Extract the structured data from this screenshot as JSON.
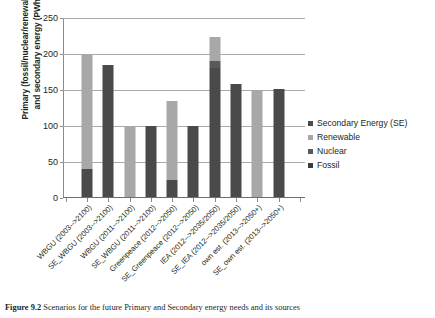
{
  "chart_data": {
    "type": "bar",
    "subtype": "stacked-bar",
    "title": "",
    "xlabel": "",
    "ylabel": "Primary (fossil/nuclear/renewable) and secondary energy (PWh)",
    "ylabel_lines": [
      "Primary (fossil/nuclear/renewable)",
      "and secondary energy (PWh)"
    ],
    "ylim": [
      0,
      250
    ],
    "yticks": [
      0,
      50,
      100,
      150,
      200,
      250
    ],
    "ytick_labels": [
      "0",
      "50",
      "100",
      "150",
      "200",
      "250"
    ],
    "grid": true,
    "grid_axis": "y",
    "legend_position": "right",
    "categories": [
      "WBGU (2003-->2100)",
      "SE_WBGU (2003-->2100)",
      "WBGU (2011-->2100)",
      "SE_WBGU (2011-->2100)",
      "Greenpeace (2012-->2050)",
      "SE_Greenpeace (2012-->2050)",
      "IEA (2012-->2035/2050)",
      "SE_IEA (2012-->2035/2050)",
      "own est. (2013-->2050+)",
      "SE_own est. (2013-->2050+)"
    ],
    "series": [
      {
        "name": "Fossil",
        "color": "#4a4a4a",
        "values": [
          40,
          0,
          0,
          0,
          25,
          0,
          180,
          0,
          0,
          0
        ]
      },
      {
        "name": "Nuclear",
        "color": "#595959",
        "values": [
          0,
          0,
          0,
          0,
          0,
          0,
          10,
          0,
          0,
          0
        ]
      },
      {
        "name": "Renewable",
        "color": "#a8a8a8",
        "values": [
          160,
          0,
          100,
          0,
          110,
          0,
          33,
          0,
          150,
          0
        ]
      },
      {
        "name": "Secondary Energy (SE)",
        "color": "#4a4a4a",
        "values": [
          0,
          185,
          0,
          100,
          0,
          100,
          0,
          158,
          0,
          151
        ]
      }
    ],
    "bar_totals": [
      200,
      185,
      100,
      100,
      135,
      100,
      223,
      158,
      150,
      151
    ],
    "annotations": []
  },
  "legend": {
    "items": [
      {
        "label": "Secondary Energy (SE)",
        "color": "#4a4a4a"
      },
      {
        "label": "Renewable",
        "color": "#a8a8a8"
      },
      {
        "label": "Nuclear",
        "color": "#595959"
      },
      {
        "label": "Fossil",
        "color": "#3d3d3d"
      }
    ]
  },
  "caption": {
    "number": "Figure 9.2",
    "text": "Scenarios for the future Primary and Secondary energy needs and its sources"
  }
}
